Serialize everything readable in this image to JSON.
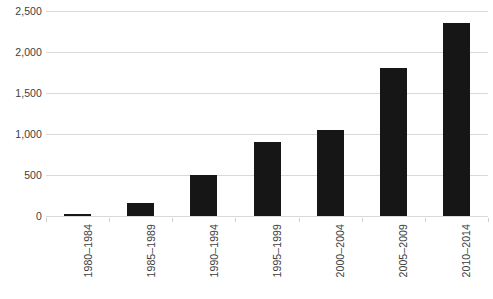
{
  "chart_data": {
    "type": "bar",
    "title": "",
    "subtitle": "",
    "xlabel": "",
    "ylabel": "",
    "categories": [
      "1980–1984",
      "1985–1989",
      "1990–1994",
      "1995–1999",
      "2000–2004",
      "2005–2009",
      "2010–2014"
    ],
    "values": [
      15,
      160,
      500,
      900,
      1050,
      1800,
      2350
    ],
    "ylim": [
      0,
      2500
    ],
    "ytick_labels": [
      "0",
      "500",
      "1,000",
      "1,500",
      "2,000",
      "2,500"
    ],
    "ytick_values": [
      0,
      500,
      1000,
      1500,
      2000,
      2500
    ],
    "grid": true,
    "legend": false,
    "legend_position": "none",
    "bar_color": "#161616",
    "gridline_color": "#d9d9d9",
    "tick_label_color": "#404040",
    "background_color": "#ffffff",
    "xtick_label_rotation": 90
  }
}
